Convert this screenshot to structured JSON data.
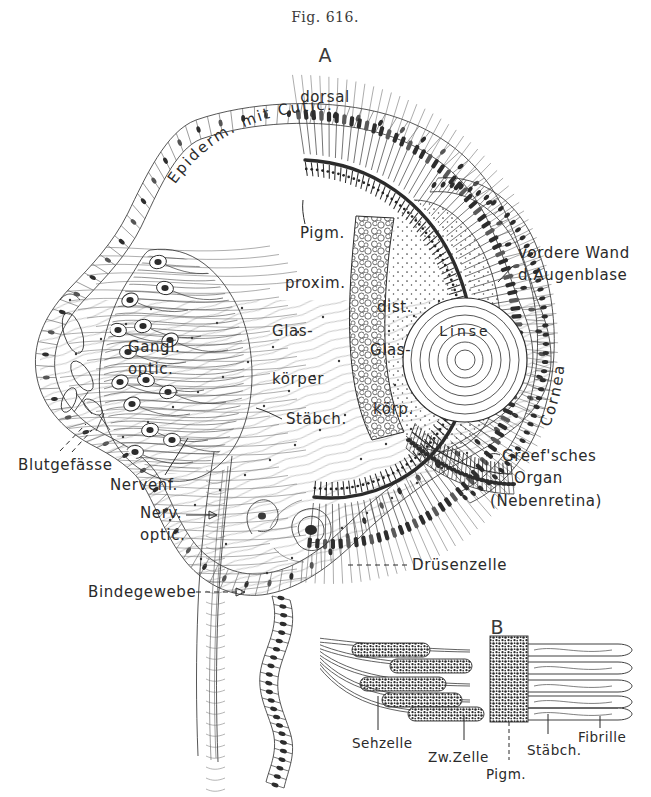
{
  "figure": {
    "caption": "Fig. 616.",
    "panel_a": "A",
    "panel_b": "B"
  },
  "orientation": {
    "dorsal": "dorsal"
  },
  "panel_a_labels": {
    "epidermis_arc": "Epiderm. mit Cutic.",
    "cornea_arc": "Cornea",
    "pigment": "Pigm.",
    "proximal": "proxim.",
    "vitreous_line1": "Glas-",
    "vitreous_line2": "körper",
    "rods": "Stäbch.",
    "distal": "dist.",
    "distal_vitreous_line1": "Glas-",
    "distal_vitreous_line2": "körp.",
    "lens": "Linse",
    "anterior_wall_line1": "vordere Wand",
    "anterior_wall_line2": "d.Augenblase",
    "ganglion_line1": "Gangl.",
    "ganglion_line2": "optic.",
    "blood_vessels": "Blutgefässe",
    "nerve_fibers": "Nervenf.",
    "optic_nerve_line1": "Nerv.",
    "optic_nerve_line2": "optic.",
    "connective_tissue": "Bindegewebe",
    "greef_line1": "Greef'sches",
    "greef_line2": "Organ",
    "greef_line3": "(Nebenretina)",
    "gland_cell": "Drüsenzelle"
  },
  "panel_b_labels": {
    "visual_cell": "Sehzelle",
    "intermediate_cell": "Zw.Zelle",
    "pigment": "Pigm.",
    "rod": "Stäbch.",
    "fibril": "Fibrille"
  },
  "style": {
    "ink": "#2b2b2b",
    "background": "#ffffff",
    "pigment_arc": "#1a1a1a"
  }
}
